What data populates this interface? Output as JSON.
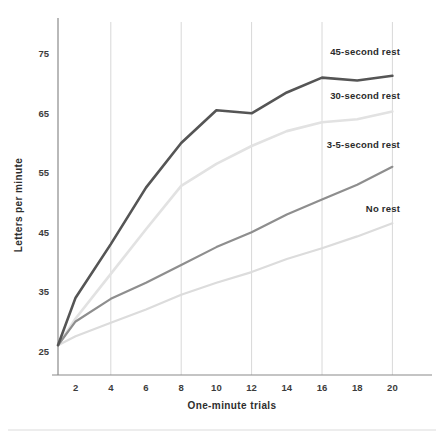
{
  "chart_data": {
    "type": "line",
    "title": "",
    "xlabel": "One-minute trials",
    "ylabel": "Letters per minute",
    "xlim": [
      1,
      21
    ],
    "ylim": [
      21,
      79
    ],
    "xticks": [
      2,
      4,
      6,
      8,
      10,
      12,
      14,
      16,
      18,
      20
    ],
    "yticks": [
      25,
      35,
      45,
      55,
      65,
      75
    ],
    "gridlines_x": [
      4,
      8,
      12,
      16,
      20
    ],
    "grid": "vertical-only",
    "legend_position": "inline-right-of-series",
    "x": [
      1,
      2,
      4,
      6,
      8,
      10,
      12,
      14,
      16,
      18,
      20
    ],
    "series": [
      {
        "name": "45-second rest",
        "color": "#555555",
        "width": 2.6,
        "label_x": 20,
        "values": [
          26,
          34,
          43,
          52.5,
          60,
          65.5,
          65,
          68.5,
          71,
          70.5,
          71.3
        ]
      },
      {
        "name": "30-second rest",
        "color": "#e2e2e2",
        "width": 2.6,
        "label_x": 20,
        "values": [
          26,
          30.5,
          38,
          45.5,
          52.8,
          56.5,
          59.5,
          62,
          63.5,
          64,
          65.3
        ]
      },
      {
        "name": "3-5-second rest",
        "color": "#8e8e8e",
        "width": 2.2,
        "label_x": 20,
        "values": [
          26,
          30,
          33.8,
          36.5,
          39.5,
          42.5,
          45,
          48,
          50.5,
          53,
          56
        ]
      },
      {
        "name": "No rest",
        "color": "#dcdcdc",
        "width": 2.2,
        "label_x": 20,
        "values": [
          26,
          27.5,
          29.8,
          32,
          34.5,
          36.5,
          38.3,
          40.5,
          42.3,
          44.3,
          46.5
        ]
      }
    ],
    "annotations": [
      {
        "text": "45-second rest",
        "x_px": 400,
        "y_px": 55,
        "anchor": "end"
      },
      {
        "text": "30-second rest",
        "x_px": 400,
        "y_px": 99,
        "anchor": "end"
      },
      {
        "text": "3-5-second rest",
        "x_px": 400,
        "y_px": 148,
        "anchor": "end"
      },
      {
        "text": "No rest",
        "x_px": 400,
        "y_px": 212,
        "anchor": "end"
      }
    ]
  }
}
